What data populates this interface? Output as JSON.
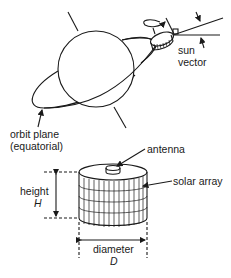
{
  "diagram": {
    "top": {
      "labels": {
        "sun_vector_line1": "sun",
        "sun_vector_line2": "vector",
        "orbit_line1": "orbit plane",
        "orbit_line2": "(equatorial)"
      }
    },
    "bottom": {
      "labels": {
        "antenna": "antenna",
        "solar_array": "solar array",
        "height_word": "height",
        "height_symbol": "H",
        "diameter_word": "diameter",
        "diameter_symbol": "D"
      }
    },
    "colors": {
      "ink": "#1a1a1a",
      "background": "#ffffff"
    }
  }
}
